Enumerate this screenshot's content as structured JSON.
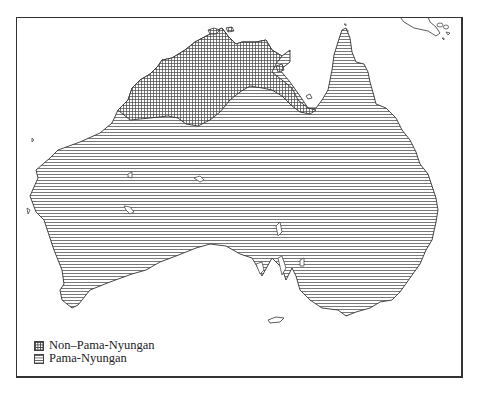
{
  "map": {
    "subject": "Australia language families",
    "regions": [
      {
        "id": "non-pama-nyungan",
        "label": "Non–Pama-Nyungan",
        "pattern": "crosshatch"
      },
      {
        "id": "pama-nyungan",
        "label": "Pama-Nyungan",
        "pattern": "horizontal-lines"
      }
    ],
    "colors": {
      "ink": "#333333",
      "background": "#ffffff"
    }
  },
  "legend": {
    "items": [
      {
        "label": "Non–Pama-Nyungan",
        "pattern": "crosshatch"
      },
      {
        "label": "Pama-Nyungan",
        "pattern": "horizontal-lines"
      }
    ]
  }
}
